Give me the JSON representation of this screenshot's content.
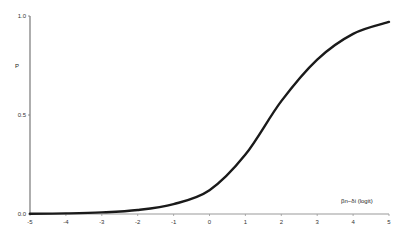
{
  "chart_data": {
    "type": "line",
    "title": "",
    "xlabel": "βn−δi (logit)",
    "ylabel": "P",
    "xlim": [
      -5,
      5
    ],
    "ylim": [
      0,
      1
    ],
    "x_ticks": [
      "-5",
      "-4",
      "-3",
      "-2",
      "-1",
      "0",
      "1",
      "2",
      "3",
      "4",
      "5"
    ],
    "y_ticks": [
      "0.0",
      "0.5",
      "1.0"
    ],
    "grid": false,
    "legend": "none",
    "series": [
      {
        "name": "P",
        "x": [
          -5,
          -4,
          -3,
          -2,
          -1,
          0,
          1,
          2,
          3,
          4,
          5
        ],
        "values": [
          0.001,
          0.003,
          0.008,
          0.02,
          0.05,
          0.12,
          0.3,
          0.57,
          0.78,
          0.91,
          0.97
        ]
      }
    ]
  }
}
